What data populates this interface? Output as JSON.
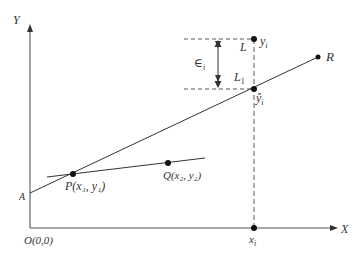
{
  "diagram": {
    "axes": {
      "y_label": "Y",
      "x_label": "X",
      "origin_label": "O(0,0)",
      "intercept_label": "A"
    },
    "points": {
      "P": {
        "label": "P",
        "coords": "(x₁, y₁)"
      },
      "Q": {
        "label": "Q",
        "coords": "(x₂, y₂)"
      },
      "R": {
        "label": "R"
      },
      "observed": {
        "label": "y",
        "subscript": "i"
      },
      "predicted": {
        "label": "ŷ",
        "subscript": "i"
      },
      "x_point": {
        "label": "x",
        "subscript": "i"
      }
    },
    "annotations": {
      "error_symbol": "∈",
      "error_subscript": "i",
      "L_label": "L",
      "L1_label": "L",
      "L1_subscript": "1"
    },
    "colors": {
      "line": "#333333",
      "axis": "#555555",
      "dash": "#444444",
      "point": "#111111"
    }
  }
}
